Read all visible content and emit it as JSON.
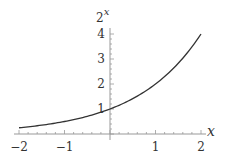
{
  "chart_data": {
    "type": "line",
    "title": "",
    "function": "2^x",
    "xlabel": "x",
    "ylabel": "2^x",
    "ylabel_base": "2",
    "ylabel_exp": "x",
    "xlim": [
      -2,
      2
    ],
    "ylim": [
      0,
      4
    ],
    "grid": false,
    "legend": null,
    "x_ticks": [
      -2,
      -1,
      1,
      2
    ],
    "x_tick_labels": [
      "−2",
      "−1",
      "1",
      "2"
    ],
    "y_ticks": [
      1,
      2,
      3,
      4
    ],
    "y_tick_labels": [
      "1",
      "2",
      "3",
      "4"
    ],
    "series": [
      {
        "name": "2^x",
        "x": [
          -2,
          -1.5,
          -1,
          -0.5,
          0,
          0.5,
          1,
          1.5,
          2
        ],
        "y": [
          0.25,
          0.354,
          0.5,
          0.707,
          1,
          1.414,
          2,
          2.828,
          4
        ]
      }
    ],
    "colors": {
      "curve": "#333333",
      "axis": "#888888",
      "text": "#333333"
    }
  }
}
